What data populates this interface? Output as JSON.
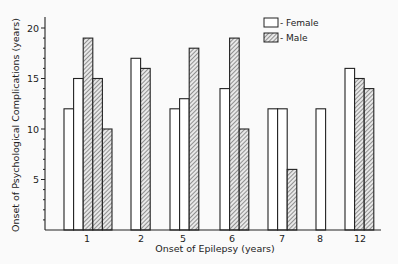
{
  "chart_data": {
    "type": "bar",
    "title": "",
    "xlabel": "Onset of Epilepsy (years)",
    "ylabel": "Onset of Psychological Complications (years)",
    "ylim": [
      0,
      20
    ],
    "yticks": [
      5,
      10,
      15,
      20
    ],
    "minor_tick_step": 1,
    "grid": false,
    "legend_position": "top-right",
    "legend": [
      {
        "name": "Female",
        "label": "- Female",
        "pattern": "open"
      },
      {
        "name": "Male",
        "label": "- Male",
        "pattern": "hatched"
      }
    ],
    "categories": [
      "1",
      "2",
      "5",
      "6",
      "7",
      "8",
      "12"
    ],
    "groups": [
      {
        "category": "1",
        "bars": [
          {
            "sex": "Female",
            "value": 12
          },
          {
            "sex": "Female",
            "value": 15
          },
          {
            "sex": "Male",
            "value": 19
          },
          {
            "sex": "Male",
            "value": 15
          },
          {
            "sex": "Male",
            "value": 10
          }
        ]
      },
      {
        "category": "2",
        "bars": [
          {
            "sex": "Female",
            "value": 17
          },
          {
            "sex": "Male",
            "value": 16
          }
        ]
      },
      {
        "category": "5",
        "bars": [
          {
            "sex": "Female",
            "value": 12
          },
          {
            "sex": "Female",
            "value": 13
          },
          {
            "sex": "Male",
            "value": 18
          }
        ]
      },
      {
        "category": "6",
        "bars": [
          {
            "sex": "Female",
            "value": 14
          },
          {
            "sex": "Male",
            "value": 19
          },
          {
            "sex": "Male",
            "value": 10
          }
        ]
      },
      {
        "category": "7",
        "bars": [
          {
            "sex": "Female",
            "value": 12
          },
          {
            "sex": "Female",
            "value": 12
          },
          {
            "sex": "Male",
            "value": 6
          }
        ]
      },
      {
        "category": "8",
        "bars": [
          {
            "sex": "Female",
            "value": 12
          }
        ]
      },
      {
        "category": "12",
        "bars": [
          {
            "sex": "Female",
            "value": 16
          },
          {
            "sex": "Male",
            "value": 15
          },
          {
            "sex": "Male",
            "value": 14
          }
        ]
      }
    ]
  },
  "layout": {
    "group_start_x": [
      64,
      131,
      170,
      220,
      268,
      316,
      345
    ],
    "label_x": [
      87,
      141,
      183,
      232,
      282,
      320,
      360
    ],
    "bar_width": 9.6
  }
}
